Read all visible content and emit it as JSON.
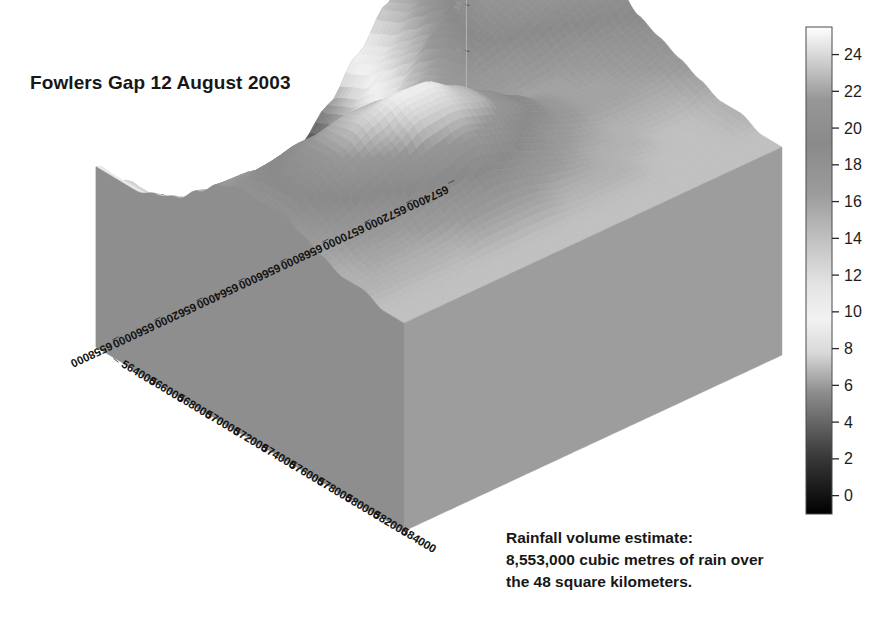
{
  "figure": {
    "title": "Fowlers Gap 12 August 2003",
    "caption_lines": [
      "Rainfall volume estimate:",
      "8,553,000 cubic metres of rain over",
      "the 48 square kilometers."
    ],
    "background_color": "#ffffff",
    "pedestal_color": "#9d9d9d",
    "pedestal_side_color": "#8e8e8e"
  },
  "chart_data": {
    "type": "heatmap",
    "render": "3d-surface",
    "title": "Fowlers Gap 12 August 2003",
    "xlabel": "",
    "ylabel": "",
    "zlabel": "",
    "colormap": "gray",
    "grid": false,
    "legend_position": "right",
    "xlim": [
      563000,
      585000
    ],
    "ylim": [
      6557000,
      6575000
    ],
    "zlim": [
      0,
      25
    ],
    "x_tick_labels": [
      "564000",
      "566000",
      "568000",
      "570000",
      "572000",
      "574000",
      "576000",
      "578000",
      "580000",
      "582000",
      "584000"
    ],
    "y_tick_labels": [
      "6574000",
      "6572000",
      "6570000",
      "6568000",
      "6566000",
      "6564000",
      "6562000",
      "6560000",
      "6558000"
    ],
    "z_tick_labels": [
      "25",
      "20",
      "15",
      "10",
      "5"
    ],
    "colorbar": {
      "min": -1,
      "max": 25.5,
      "ticks": [
        0,
        2,
        4,
        6,
        8,
        10,
        12,
        14,
        16,
        18,
        20,
        22,
        24
      ],
      "tick_labels": [
        "0",
        "2",
        "4",
        "6",
        "8",
        "10",
        "12",
        "14",
        "16",
        "18",
        "20",
        "22",
        "24"
      ],
      "units": "mm"
    },
    "surface_notes": {
      "low_basin_value": 1,
      "high_ridge_value": 25,
      "mid_plateau_value": 14
    },
    "z_grid": [
      [
        22,
        23,
        24,
        25,
        25,
        24,
        23,
        21,
        19,
        18,
        17,
        16,
        15,
        15,
        14,
        14
      ],
      [
        21,
        22,
        23,
        24,
        24,
        23,
        22,
        20,
        18,
        17,
        16,
        15,
        14,
        14,
        14,
        14
      ],
      [
        18,
        19,
        21,
        22,
        23,
        22,
        21,
        19,
        17,
        16,
        16,
        15,
        14,
        14,
        14,
        14
      ],
      [
        14,
        15,
        17,
        19,
        21,
        21,
        20,
        18,
        16,
        16,
        16,
        15,
        15,
        14,
        14,
        14
      ],
      [
        10,
        11,
        13,
        15,
        18,
        19,
        19,
        17,
        16,
        17,
        17,
        16,
        15,
        15,
        14,
        14
      ],
      [
        6,
        7,
        9,
        11,
        14,
        16,
        17,
        17,
        17,
        19,
        19,
        17,
        16,
        15,
        14,
        14
      ],
      [
        3,
        4,
        5,
        7,
        10,
        13,
        15,
        17,
        19,
        21,
        21,
        19,
        17,
        15,
        14,
        14
      ],
      [
        1,
        2,
        3,
        4,
        7,
        10,
        14,
        17,
        21,
        23,
        23,
        21,
        18,
        16,
        14,
        14
      ],
      [
        1,
        1,
        2,
        3,
        5,
        9,
        13,
        18,
        22,
        25,
        24,
        22,
        19,
        16,
        14,
        14
      ],
      [
        2,
        2,
        2,
        3,
        5,
        9,
        14,
        19,
        23,
        25,
        24,
        21,
        18,
        16,
        14,
        14
      ],
      [
        3,
        3,
        3,
        4,
        6,
        10,
        15,
        20,
        23,
        24,
        22,
        20,
        17,
        15,
        14,
        14
      ],
      [
        5,
        5,
        5,
        6,
        8,
        12,
        16,
        20,
        22,
        22,
        21,
        18,
        16,
        15,
        14,
        14
      ],
      [
        8,
        8,
        8,
        9,
        11,
        14,
        17,
        19,
        20,
        20,
        19,
        17,
        16,
        15,
        14,
        14
      ],
      [
        11,
        11,
        11,
        12,
        13,
        15,
        17,
        18,
        18,
        18,
        17,
        16,
        15,
        15,
        14,
        14
      ]
    ]
  },
  "colorbar_ui": {
    "orientation": "vertical",
    "tick_side": "right"
  }
}
